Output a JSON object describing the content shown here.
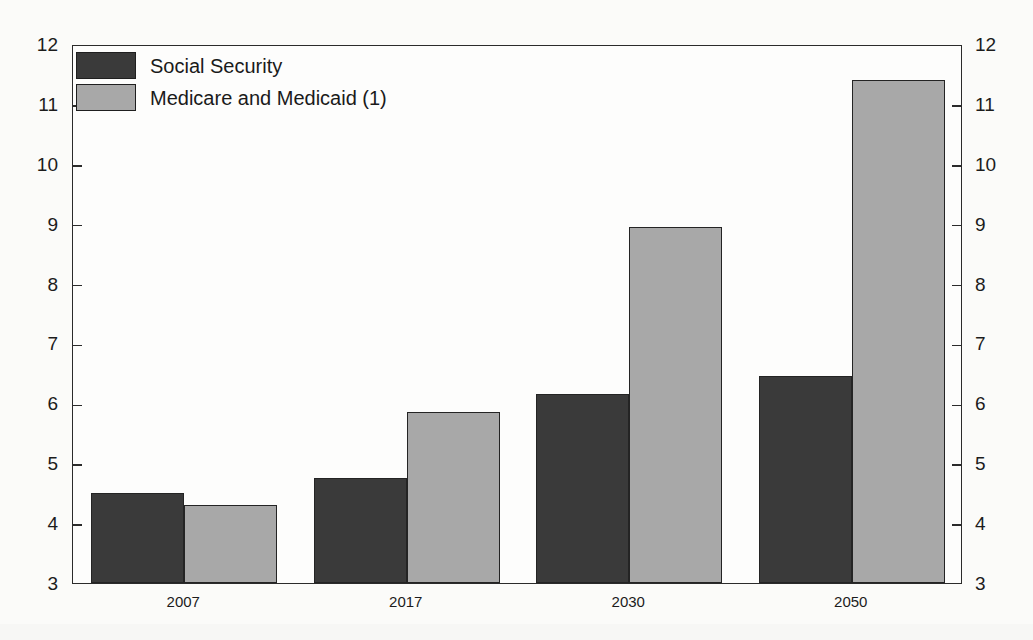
{
  "chart_data": {
    "type": "bar",
    "title": "",
    "subtitle": "",
    "xlabel": "",
    "ylabel": "",
    "categories": [
      "2007",
      "2017",
      "2030",
      "2050"
    ],
    "series": [
      {
        "name": "Social Security",
        "color": "#3a3a3a",
        "values": [
          4.5,
          4.75,
          6.15,
          6.45
        ]
      },
      {
        "name": "Medicare and Medicaid (1)",
        "color": "#a8a8a8",
        "values": [
          4.3,
          5.85,
          8.95,
          11.4
        ]
      }
    ],
    "ylim": [
      3,
      12
    ],
    "y_ticks": [
      3,
      4,
      5,
      6,
      7,
      8,
      9,
      10,
      11,
      12
    ],
    "y_ticks_right": [
      3,
      4,
      5,
      6,
      7,
      8,
      9,
      10,
      11,
      12
    ],
    "grid": false,
    "legend_position": "top-left",
    "dual_y_axis": true,
    "annotations": []
  },
  "legend": {
    "entries": [
      {
        "label": "Social Security",
        "swatch": "dark-swatch"
      },
      {
        "label": "Medicare and Medicaid (1)",
        "swatch": "light-swatch"
      }
    ]
  },
  "colors": {
    "series_dark": "#3a3a3a",
    "series_light": "#a8a8a8",
    "axis": "#2b2b2b",
    "background": "#fbfbf9",
    "text": "#1c1c1c"
  }
}
